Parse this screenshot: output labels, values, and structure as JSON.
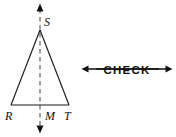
{
  "figure": {
    "background_color": "#ffffff",
    "stroke_color": "#1a1a1a",
    "dash_color": "#6d6d6d",
    "triangle": {
      "name": "triangle-RST",
      "apex": {
        "label": "S",
        "x": 40,
        "y": 30
      },
      "left": {
        "label": "R",
        "x": 11,
        "y": 105
      },
      "right": {
        "label": "T",
        "x": 69,
        "y": 105
      }
    },
    "midpoint": {
      "label": "M",
      "x": 40,
      "y": 105
    },
    "axis": {
      "name": "axis-of-symmetry",
      "style": "dashed",
      "x": 40,
      "top_y": 4,
      "bottom_y": 133,
      "arrow_top": true,
      "arrow_bottom": true
    },
    "labels": {
      "apex_label": "S",
      "left_label": "R",
      "mid_label": "M",
      "right_label": "T"
    }
  },
  "annotation": {
    "name": "check-strikethrough-arrow",
    "text": "CHECK",
    "strikethrough": true,
    "arrow_left": true,
    "arrow_right": true,
    "line_y": 69,
    "start_x": 82,
    "end_x": 172,
    "color": "#111111"
  }
}
